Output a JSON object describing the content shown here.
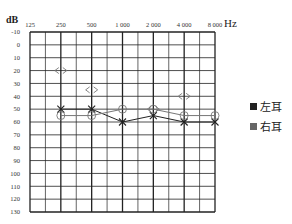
{
  "chart_data": {
    "type": "line",
    "title": "",
    "xlabel": "Hz",
    "ylabel": "dB",
    "x_scale": "log2",
    "x_ticks": [
      125,
      250,
      500,
      1000,
      2000,
      4000,
      8000
    ],
    "x_tick_labels": [
      "125",
      "250",
      "500",
      "1 000",
      "2 000",
      "4 000",
      "8 000"
    ],
    "y_ticks": [
      -10,
      0,
      10,
      20,
      30,
      40,
      50,
      60,
      70,
      80,
      90,
      100,
      110,
      120,
      130
    ],
    "y_tick_labels": [
      "-10",
      "0",
      "10",
      "20",
      "30",
      "40",
      "50",
      "60",
      "70",
      "80",
      "90",
      "100",
      "110",
      "120",
      "130"
    ],
    "ylim": [
      -10,
      130
    ],
    "y_inverted": true,
    "grid": true,
    "series": [
      {
        "name": "左耳",
        "marker": "x",
        "color": "#222222",
        "connected": true,
        "x": [
          250,
          500,
          1000,
          2000,
          4000,
          8000
        ],
        "values": [
          50,
          50,
          60,
          55,
          60,
          60
        ]
      },
      {
        "name": "右耳",
        "marker": "o",
        "color": "#777777",
        "connected": true,
        "x": [
          250,
          500,
          1000,
          2000,
          4000,
          8000
        ],
        "values": [
          55,
          55,
          50,
          50,
          55,
          55
        ]
      },
      {
        "name": "bone-conduction",
        "marker": "<>",
        "color": "#777777",
        "connected": false,
        "x": [
          250,
          500,
          2000,
          4000
        ],
        "values": [
          20,
          35,
          50,
          40
        ]
      }
    ],
    "legend": {
      "position": "right",
      "entries": [
        {
          "label": "左耳",
          "color": "#222222"
        },
        {
          "label": "右耳",
          "color": "#666666"
        }
      ]
    }
  }
}
